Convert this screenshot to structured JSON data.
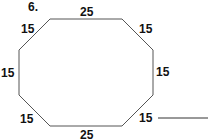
{
  "problem": {
    "number": "6.",
    "shape": "octagon"
  },
  "sides": [
    {
      "position": "top",
      "label": "25"
    },
    {
      "position": "top-right",
      "label": "15"
    },
    {
      "position": "right",
      "label": "15"
    },
    {
      "position": "bottom-right",
      "label": "15"
    },
    {
      "position": "bottom",
      "label": "25"
    },
    {
      "position": "bottom-left",
      "label": "15"
    },
    {
      "position": "left",
      "label": "15"
    },
    {
      "position": "top-left",
      "label": "15"
    }
  ],
  "answer": {
    "value": ""
  },
  "colors": {
    "stroke": "#555555",
    "text": "#111111"
  }
}
